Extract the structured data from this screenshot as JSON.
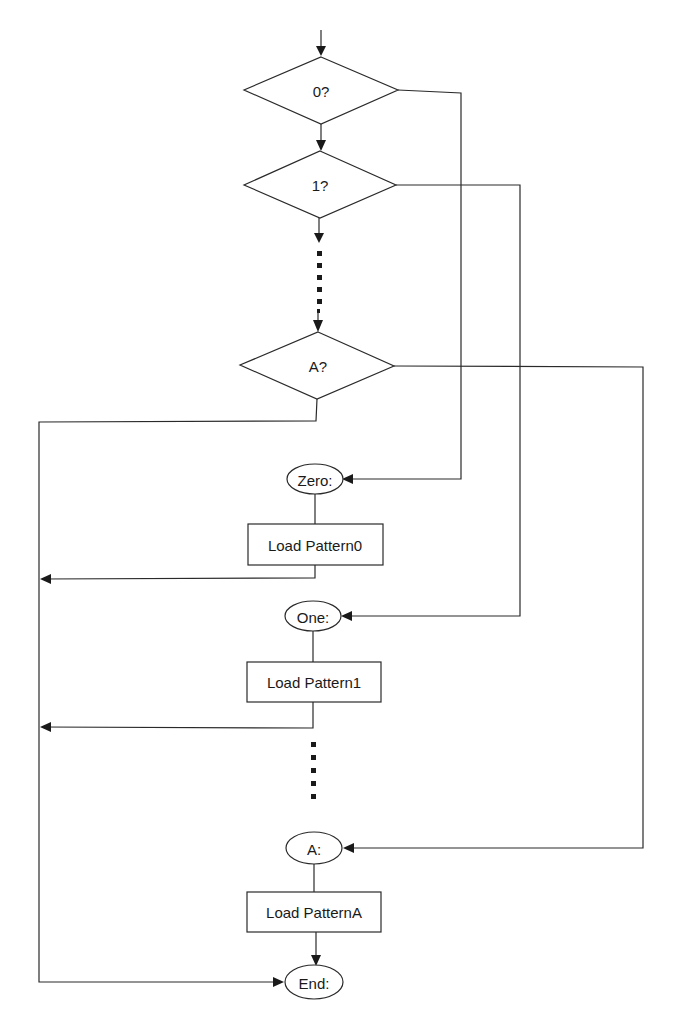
{
  "diagram": {
    "type": "flowchart",
    "decisions": [
      {
        "id": "d0",
        "label": "0?"
      },
      {
        "id": "d1",
        "label": "1?"
      },
      {
        "id": "dA",
        "label": "A?"
      }
    ],
    "labels": [
      {
        "id": "zero",
        "label": "Zero:"
      },
      {
        "id": "one",
        "label": "One:"
      },
      {
        "id": "a",
        "label": "A:"
      },
      {
        "id": "end",
        "label": "End:"
      }
    ],
    "processes": [
      {
        "id": "p0",
        "label": "Load Pattern0"
      },
      {
        "id": "p1",
        "label": "Load Pattern1"
      },
      {
        "id": "pA",
        "label": "Load PatternA"
      }
    ],
    "edges": [
      {
        "from": "start",
        "to": "d0"
      },
      {
        "from": "d0",
        "to": "d1",
        "branch": "no"
      },
      {
        "from": "d0",
        "to": "zero",
        "branch": "yes"
      },
      {
        "from": "d1",
        "to": "dA",
        "branch": "no",
        "style": "dotted"
      },
      {
        "from": "d1",
        "to": "one",
        "branch": "yes"
      },
      {
        "from": "dA",
        "to": "a",
        "branch": "yes"
      },
      {
        "from": "dA",
        "to": "end",
        "branch": "no"
      },
      {
        "from": "zero",
        "to": "p0"
      },
      {
        "from": "p0",
        "to": "end"
      },
      {
        "from": "one",
        "to": "p1"
      },
      {
        "from": "p1",
        "to": "end"
      },
      {
        "from": "a",
        "to": "pA"
      },
      {
        "from": "pA",
        "to": "end"
      }
    ],
    "colors": {
      "line": "#2a2a2a",
      "background": "#ffffff"
    }
  }
}
